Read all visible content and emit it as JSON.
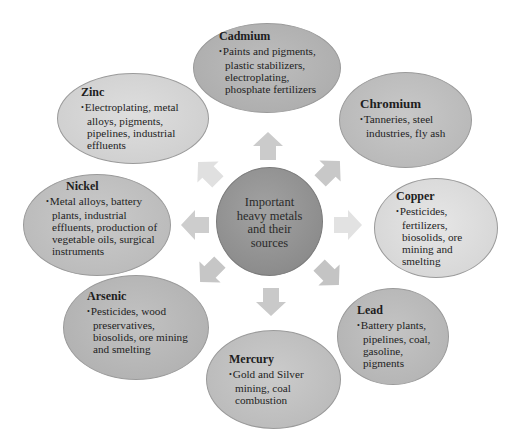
{
  "center": {
    "label": "Important heavy metals and their sources",
    "lines": [
      "Important",
      "heavy metals",
      "and their",
      "sources"
    ],
    "color": "#929292"
  },
  "nodes": [
    {
      "id": "cadmium",
      "title": "Cadmium",
      "item": "Paints and pigments, plastic stabilizers, electroplating, phosphate fertilizers",
      "color": "#b4b4b4"
    },
    {
      "id": "chromium",
      "title": "Chromium",
      "item": "Tanneries, steel industries, fly ash",
      "color": "#c0c0c0"
    },
    {
      "id": "copper",
      "title": "Copper",
      "item": "Pesticides, fertilizers, biosolids, ore mining and smelting",
      "color": "#dcdcdc"
    },
    {
      "id": "lead",
      "title": "Lead",
      "item": "Battery plants, pipelines, coal, gasoline, pigments",
      "color": "#bcbcbc"
    },
    {
      "id": "mercury",
      "title": "Mercury",
      "item": "Gold and Silver mining, coal combustion",
      "color": "#c4c4c4"
    },
    {
      "id": "arsenic",
      "title": "Arsenic",
      "item": "Pesticides, wood preservatives, biosolids, ore mining and smelting",
      "color": "#bababa"
    },
    {
      "id": "nickel",
      "title": "Nickel",
      "item": "Metal alloys, battery plants, industrial effluents, production of vegetable oils, surgical instruments",
      "color": "#c2c2c2"
    },
    {
      "id": "zinc",
      "title": "Zinc",
      "item": "Electroplating, metal alloys, pigments, pipelines, industrial effluents",
      "color": "#d6d6d6"
    }
  ],
  "arrow_color": "#cfcfcf"
}
